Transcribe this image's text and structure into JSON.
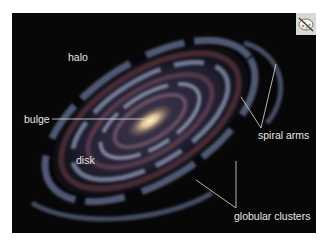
{
  "figure": {
    "labels": {
      "halo": "halo",
      "bulge": "bulge",
      "disk": "disk",
      "spiral_arms": "spiral arms",
      "globular_clusters": "globular clusters"
    },
    "corner_icon": "palette-icon",
    "colors": {
      "background": "#070708",
      "label_text": "#e6e6e6",
      "bulge_core": "#f3e2b8",
      "arm_blue": "#aab6d8",
      "dust_red": "#6a3a4a",
      "icon_box": "#d7d9d6"
    }
  }
}
